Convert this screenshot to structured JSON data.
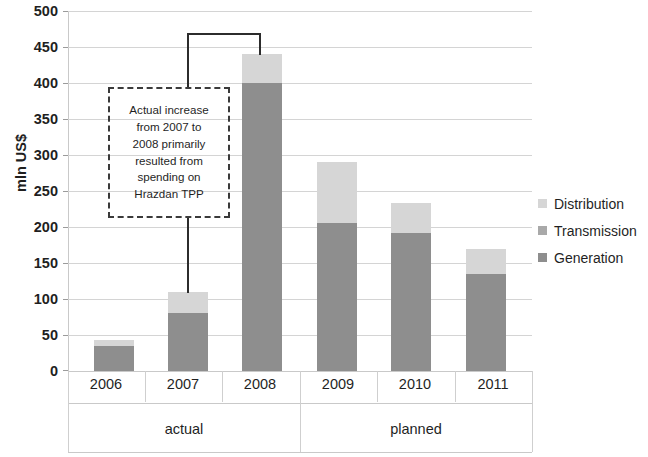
{
  "chart_data": {
    "type": "bar",
    "subtype": "stacked",
    "title": "",
    "xlabel": "",
    "ylabel": "mln US$",
    "ylim": [
      0,
      500
    ],
    "ytick_step": 50,
    "yticks": [
      "500",
      "450",
      "400",
      "350",
      "300",
      "250",
      "200",
      "150",
      "100",
      "50",
      "0"
    ],
    "grid": true,
    "legend_position": "right",
    "categories": [
      "2006",
      "2007",
      "2008",
      "2009",
      "2010",
      "2011"
    ],
    "groups": [
      {
        "label": "actual",
        "categories": [
          "2006",
          "2007",
          "2008"
        ]
      },
      {
        "label": "planned",
        "categories": [
          "2009",
          "2010",
          "2011"
        ]
      }
    ],
    "series": [
      {
        "name": "Generation",
        "color": "#8e8e8e",
        "values": [
          35,
          80,
          400,
          205,
          192,
          135
        ]
      },
      {
        "name": "Transmission",
        "color": "#a9a9a9",
        "values": [
          0,
          0,
          0,
          0,
          0,
          0
        ]
      },
      {
        "name": "Distribution",
        "color": "#d6d6d6",
        "values": [
          8,
          30,
          40,
          85,
          41,
          35
        ]
      }
    ],
    "totals": [
      43,
      110,
      440,
      290,
      233,
      170
    ],
    "annotations": [
      {
        "name": "hrazdan-callout",
        "text": "Actual increase from 2007 to 2008 primarily resulted from spending on Hrazdan TPP",
        "lines": [
          "Actual increase",
          "from 2007 to",
          "2008 primarily",
          "resulted from",
          "spending on",
          "Hrazdan TPP"
        ],
        "points_to": [
          "2007",
          "2008"
        ]
      }
    ]
  },
  "legend": {
    "items": [
      {
        "label": "Distribution",
        "color": "#d6d6d6"
      },
      {
        "label": "Transmission",
        "color": "#a9a9a9"
      },
      {
        "label": "Generation",
        "color": "#8e8e8e"
      }
    ]
  }
}
